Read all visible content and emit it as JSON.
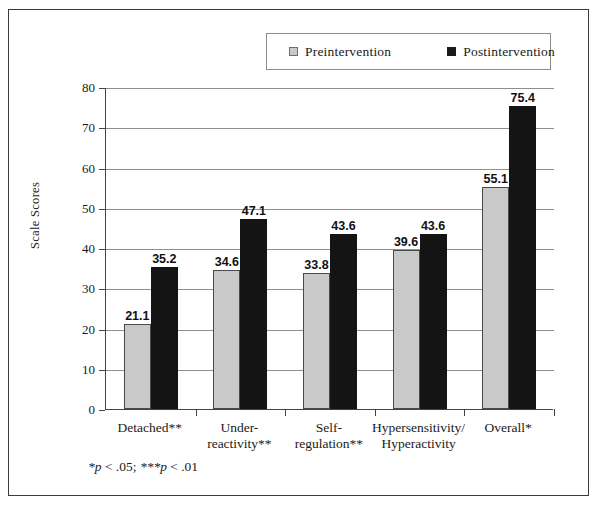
{
  "chart_data": {
    "type": "bar",
    "title": "",
    "xlabel": "",
    "ylabel": "Scale Scores",
    "ylim": [
      0,
      80
    ],
    "yticks": [
      0,
      10,
      20,
      30,
      40,
      50,
      60,
      70,
      80
    ],
    "grid": true,
    "legend_position": "top-center",
    "categories": [
      "Detached**",
      "Under-\nreactivity**",
      "Self-\nregulation**",
      "Hypersensitivity/\nHyperactivity",
      "Overall*"
    ],
    "series": [
      {
        "name": "Preintervention",
        "color": "#c9c9c9",
        "values": [
          21.1,
          34.6,
          33.8,
          39.6,
          55.1
        ],
        "labels": [
          "21.1",
          "34.6",
          "33.8",
          "39.6",
          "55.1"
        ]
      },
      {
        "name": "Postintervention",
        "color": "#141414",
        "values": [
          35.2,
          47.1,
          43.6,
          43.6,
          75.4
        ],
        "labels": [
          "35.2",
          "47.1",
          "43.6",
          "43.6",
          "75.4"
        ]
      }
    ],
    "annotations": [
      "*p < .05; ***p < .01"
    ]
  },
  "legend": {
    "entries": [
      {
        "label": "Preintervention",
        "swatch": "light-gray-square"
      },
      {
        "label": "Postintervention",
        "swatch": "black-square"
      }
    ]
  },
  "axes": {
    "y_title": "Scale Scores",
    "y_tick_labels": [
      "80",
      "70",
      "60",
      "50",
      "40",
      "30",
      "20",
      "10",
      "0"
    ]
  },
  "footnote": {
    "part1": "*p",
    "part2": " < .05; ",
    "part3": "***p",
    "part4": " < .01"
  },
  "colors": {
    "preintervention": "#c9c9c9",
    "postintervention": "#141414",
    "gridline": "#8e8e8e",
    "axis": "#444444",
    "frame": "#3a3a3a"
  }
}
